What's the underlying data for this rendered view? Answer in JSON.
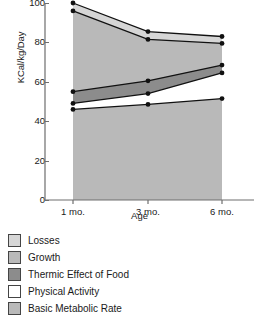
{
  "chart_data": {
    "type": "area",
    "stacked": true,
    "title": "",
    "xlabel": "Age",
    "ylabel": "KCal/kg/Day",
    "categories": [
      "1 mo.",
      "3 mo.",
      "6 mo."
    ],
    "x_tick_labels": [
      "1 mo.",
      "3 mo.",
      "6 mo."
    ],
    "y_tick_labels": [
      "0",
      "20",
      "40",
      "60",
      "80",
      "100"
    ],
    "y_ticks": [
      0,
      20,
      40,
      60,
      80,
      100
    ],
    "ylim": [
      0,
      100
    ],
    "grid": false,
    "legend_position": "below",
    "markers": "filled-circle",
    "series": [
      {
        "name": "Basic Metabolic Rate",
        "color": "#b9b9b9",
        "values": [
          46,
          48.5,
          51.5
        ],
        "cumulative": [
          46,
          48.5,
          51.5
        ]
      },
      {
        "name": "Physical Activity",
        "color": "#ffffff",
        "values": [
          3,
          5.5,
          13
        ],
        "cumulative": [
          49,
          54,
          64.5
        ]
      },
      {
        "name": "Thermic Effect of Food",
        "color": "#8c8c8c",
        "values": [
          6,
          6.5,
          4
        ],
        "cumulative": [
          55,
          60.5,
          68.5
        ]
      },
      {
        "name": "Growth",
        "color": "#b9b9b9",
        "values": [
          41,
          21,
          11
        ],
        "cumulative": [
          96,
          81.5,
          79.5
        ]
      },
      {
        "name": "Losses",
        "color": "#d6d6d6",
        "values": [
          4,
          4,
          3.5
        ],
        "cumulative": [
          100,
          85.5,
          83
        ]
      }
    ]
  },
  "legend": {
    "items": [
      {
        "label": "Losses",
        "color": "#d6d6d6"
      },
      {
        "label": "Growth",
        "color": "#b9b9b9"
      },
      {
        "label": "Thermic Effect of Food",
        "color": "#8c8c8c"
      },
      {
        "label": "Physical Activity",
        "color": "#ffffff"
      },
      {
        "label": "Basic Metabolic Rate",
        "color": "#b9b9b9"
      }
    ]
  }
}
